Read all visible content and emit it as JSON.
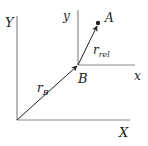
{
  "diagram": {
    "labels": {
      "big_y": "Y",
      "big_x": "X",
      "small_y": "y",
      "small_x": "x",
      "point_a": "A",
      "point_b": "B",
      "r_b_main": "r",
      "r_b_sub": "B",
      "r_rel_main": "r",
      "r_rel_sub": "rel"
    },
    "colors": {
      "axis": "#888888",
      "vector": "#222222",
      "text": "#222222"
    }
  }
}
